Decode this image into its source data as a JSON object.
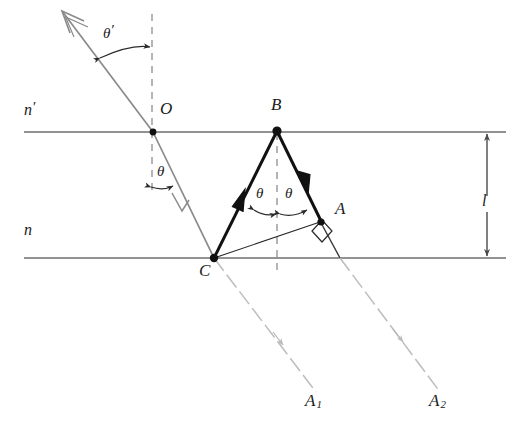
{
  "figure": {
    "background_color": "#ffffff",
    "width": 523,
    "height": 438
  },
  "colors": {
    "ray_bold": "#111111",
    "ray_incident": "#8a8a8a",
    "ray_exit_dashed": "#b4b4b4",
    "interface_line": "#6e6e6e",
    "construction_dashed": "#8d8d8d",
    "text": "#1b1b1b"
  },
  "media": {
    "upper_label": "n",
    "upper_prime": "′",
    "lower_label": "n"
  },
  "points": {
    "O": {
      "label": "O",
      "x": 153,
      "y": 132
    },
    "B": {
      "label": "B",
      "x": 277,
      "y": 131
    },
    "A": {
      "label": "A",
      "x": 320,
      "y": 221
    },
    "C": {
      "label": "C",
      "x": 214,
      "y": 258
    },
    "A1": {
      "label": "A",
      "sub": "1",
      "x": 312,
      "y": 405
    },
    "A2": {
      "label": "A",
      "sub": "2",
      "x": 436,
      "y": 405
    }
  },
  "angles": {
    "theta_prime": {
      "label": "θ",
      "prime": "′"
    },
    "theta_incidence_in_medium": {
      "label": "θ"
    },
    "theta_left_in_prism": {
      "label": "θ"
    },
    "theta_right_in_prism": {
      "label": "θ"
    }
  },
  "dimension": {
    "thickness_label": "l"
  },
  "interfaces": {
    "top_y": 132,
    "bottom_y": 258,
    "left_x": 24,
    "right_x": 506
  },
  "geometry_notes": {
    "right_angle_marker_at": "A",
    "normals_dashed_at": [
      "O",
      "B"
    ]
  }
}
